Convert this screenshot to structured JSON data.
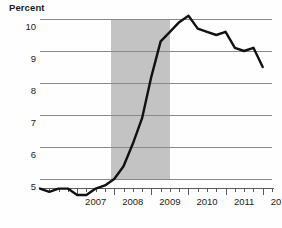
{
  "chart_data": {
    "type": "line",
    "title": "Percent",
    "xlabel": "",
    "ylabel": "Percent",
    "ylim": [
      4.3,
      10.4
    ],
    "xlim": [
      2006.0,
      2012.25
    ],
    "grid": true,
    "legend": null,
    "yticks": [
      5,
      6,
      7,
      8,
      9,
      10
    ],
    "ytick_labels": [
      "5",
      "6",
      "7",
      "8",
      "9",
      "10"
    ],
    "xticks": [
      2007,
      2008,
      2009,
      2010,
      2011,
      2012
    ],
    "xtick_labels": [
      "2007",
      "2008",
      "2009",
      "2010",
      "2011",
      "2012"
    ],
    "minor_tick_interval_years": 0.25,
    "series": [
      {
        "name": "Unemployment rate",
        "color": "#111111",
        "x": [
          2006.0,
          2006.25,
          2006.5,
          2006.75,
          2007.0,
          2007.25,
          2007.5,
          2007.75,
          2008.0,
          2008.25,
          2008.5,
          2008.75,
          2009.0,
          2009.25,
          2009.5,
          2009.75,
          2010.0,
          2010.25,
          2010.5,
          2010.75,
          2011.0,
          2011.25,
          2011.5,
          2011.75,
          2012.0
        ],
        "values": [
          4.7,
          4.6,
          4.7,
          4.7,
          4.5,
          4.5,
          4.7,
          4.8,
          5.0,
          5.4,
          6.1,
          6.9,
          8.2,
          9.3,
          9.6,
          9.9,
          10.1,
          9.7,
          9.6,
          9.5,
          9.6,
          9.1,
          9.0,
          9.1,
          8.5
        ]
      }
    ],
    "shaded_regions": [
      {
        "label": "recession",
        "color": "#c3c3c3",
        "x_start": 2007.92,
        "x_end": 2009.5
      }
    ]
  }
}
